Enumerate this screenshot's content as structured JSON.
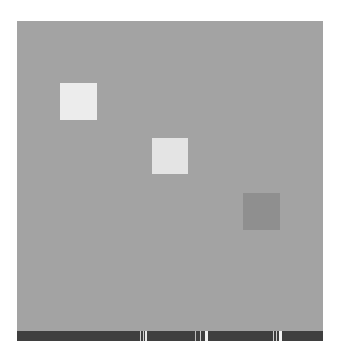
{
  "scene": {
    "background_color": "#a3a3a3",
    "squares": [
      {
        "id": "square-1",
        "x": 43,
        "y": 62,
        "size": 37,
        "color": "#ececec"
      },
      {
        "id": "square-2",
        "x": 135,
        "y": 117,
        "size": 36,
        "color": "#e4e4e4"
      },
      {
        "id": "square-3",
        "x": 226,
        "y": 172,
        "size": 37,
        "color": "#8f8f8f"
      }
    ]
  },
  "bottom_bar": {
    "color": "#3f3f3f",
    "marks": [
      {
        "x": 123,
        "width": 1,
        "color": "#cfcfcf"
      },
      {
        "x": 126,
        "width": 1,
        "color": "#cfcfcf"
      },
      {
        "x": 128,
        "width": 2,
        "color": "#e6e6e6"
      },
      {
        "x": 178,
        "width": 1,
        "color": "#bdbdbd"
      },
      {
        "x": 183,
        "width": 1,
        "color": "#cfcfcf"
      },
      {
        "x": 188,
        "width": 3,
        "color": "#f2f2f2"
      },
      {
        "x": 256,
        "width": 1,
        "color": "#cfcfcf"
      },
      {
        "x": 259,
        "width": 1,
        "color": "#cfcfcf"
      },
      {
        "x": 262,
        "width": 3,
        "color": "#f2f2f2"
      }
    ]
  }
}
